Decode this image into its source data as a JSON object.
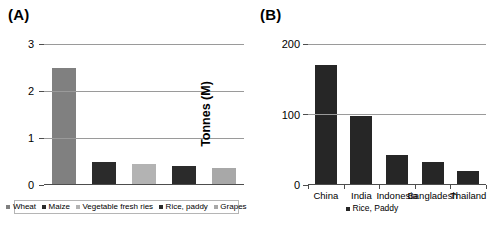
{
  "figure": {
    "panels": [
      {
        "label": "(A)",
        "ylabel": "Tonnes (M)",
        "legend": [
          {
            "name": "Wheat",
            "color": "#808080"
          },
          {
            "name": "Maize",
            "color": "#2b2b2b"
          },
          {
            "name": "Vegetable fresh ries",
            "color": "#b3b3b3"
          },
          {
            "name": "Rice, paddy",
            "color": "#2b2b2b"
          },
          {
            "name": "Grapes",
            "color": "#a8a8a8"
          }
        ]
      },
      {
        "label": "(B)",
        "ylabel": "Tonnes (M)",
        "legend": [
          {
            "name": "Rice, Paddy",
            "color": "#262626"
          }
        ]
      }
    ]
  },
  "chart_data": [
    {
      "type": "bar",
      "title": "(A)",
      "xlabel": "",
      "ylabel": "Tonnes (M)",
      "categories": [
        "Wheat",
        "Maize",
        "Vegetable fresh ries",
        "Rice, paddy",
        "Grapes"
      ],
      "values": [
        2.5,
        0.5,
        0.45,
        0.4,
        0.37
      ],
      "colors": [
        "#808080",
        "#2b2b2b",
        "#b3b3b3",
        "#2b2b2b",
        "#a8a8a8"
      ],
      "ylim": [
        0,
        3
      ],
      "yticks": [
        0,
        1,
        2,
        3
      ],
      "ytick_labels": [
        "0",
        "1",
        "2",
        "3"
      ],
      "grid": true,
      "legend_position": "bottom",
      "xtick_labels": []
    },
    {
      "type": "bar",
      "title": "(B)",
      "xlabel": "",
      "ylabel": "Tonnes (M)",
      "categories": [
        "China",
        "India",
        "Indonesia",
        "Bangladesh",
        "Thailand"
      ],
      "series": [
        {
          "name": "Rice, Paddy",
          "values": [
            170,
            98,
            42,
            32,
            20
          ]
        }
      ],
      "values": [
        170,
        98,
        42,
        32,
        20
      ],
      "colors": [
        "#262626",
        "#262626",
        "#262626",
        "#262626",
        "#262626"
      ],
      "ylim": [
        0,
        200
      ],
      "yticks": [
        0,
        100,
        200
      ],
      "ytick_labels": [
        "0",
        "100",
        "200"
      ],
      "grid": true,
      "legend_position": "bottom",
      "xtick_labels": [
        "China",
        "India",
        "Indonesia",
        "Bangladesh",
        "Thailand"
      ]
    }
  ]
}
